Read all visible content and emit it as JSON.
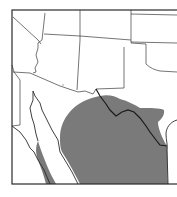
{
  "map": {
    "type": "species-range-map",
    "region": "Southwestern United States and northern Mexico",
    "colors": {
      "background": "#ffffff",
      "range_fill": "#7a7a7a",
      "borders": "#3a3a3a",
      "frame": "#2b2b2b"
    },
    "legend": null,
    "labels": []
  }
}
